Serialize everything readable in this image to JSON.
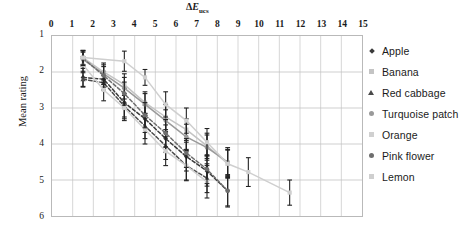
{
  "chart_data": {
    "type": "scatter",
    "title": "",
    "xlabel": "ΔEucs",
    "xlabel_parts": {
      "delta": "Δ",
      "italic": "E",
      "sub": "ucs"
    },
    "ylabel": "Mean rating",
    "xlim": [
      0,
      15
    ],
    "ylim": [
      1,
      6
    ],
    "y_inverted": true,
    "xticks": [
      0,
      1,
      2,
      3,
      4,
      5,
      6,
      7,
      8,
      9,
      10,
      11,
      12,
      13,
      14,
      15
    ],
    "yticks": [
      1,
      2,
      3,
      4,
      5,
      6
    ],
    "grid": true,
    "legend_position": "right",
    "errorbars": true,
    "series": [
      {
        "name": "Apple",
        "color": "#3a3a3a",
        "marker": "diamond",
        "line": "dashed",
        "x": [
          1.5,
          2.5,
          3.5,
          4.5,
          5.5,
          6.5,
          7.5,
          8.5
        ],
        "y": [
          2.15,
          2.2,
          2.85,
          3.3,
          3.85,
          4.35,
          4.75,
          5.3
        ],
        "err": [
          0.25,
          0.22,
          0.4,
          0.38,
          0.38,
          0.4,
          0.42,
          0.42
        ]
      },
      {
        "name": "Banana",
        "color": "#c4c4c4",
        "marker": "square",
        "line": "solid",
        "x": [
          1.5,
          2.5,
          3.5,
          4.5,
          5.5,
          6.5,
          7.5,
          8.5
        ],
        "y": [
          1.6,
          2.0,
          2.35,
          2.85,
          3.25,
          3.6,
          4.05,
          4.55
        ],
        "err": [
          0.2,
          0.25,
          0.3,
          0.3,
          0.35,
          0.3,
          0.35,
          0.38
        ]
      },
      {
        "name": "Red cabbage",
        "color": "#4a4a4a",
        "marker": "triangle",
        "line": "dashed",
        "x": [
          1.5,
          2.5,
          3.5,
          4.5,
          5.5,
          6.5,
          7.5
        ],
        "y": [
          2.2,
          2.3,
          2.95,
          3.5,
          4.05,
          4.6,
          4.95
        ],
        "err": [
          0.22,
          0.2,
          0.35,
          0.35,
          0.38,
          0.4,
          0.4
        ]
      },
      {
        "name": "Turquoise patch",
        "color": "#9a9a9a",
        "marker": "circle",
        "line": "solid",
        "x": [
          1.5,
          2.5,
          3.5,
          4.5,
          5.5,
          6.5,
          7.5,
          8.5
        ],
        "y": [
          1.65,
          2.05,
          2.45,
          2.9,
          3.35,
          3.8,
          4.1,
          4.5
        ],
        "err": [
          0.2,
          0.25,
          0.3,
          0.3,
          0.3,
          0.35,
          0.35,
          0.4
        ]
      },
      {
        "name": "Orange",
        "color": "#d0d0d0",
        "marker": "square",
        "line": "solid",
        "x": [
          1.5,
          2.5,
          3.5,
          4.5,
          5.5,
          6.5,
          7.5
        ],
        "y": [
          1.8,
          2.5,
          3.0,
          3.6,
          4.2,
          4.6,
          5.05
        ],
        "err": [
          0.22,
          0.3,
          0.35,
          0.4,
          0.4,
          0.42,
          0.45
        ]
      },
      {
        "name": "Pink flower",
        "color": "#6e6e6e",
        "marker": "circle",
        "line": "dashed",
        "x": [
          1.5,
          2.5,
          3.5,
          4.5,
          5.5,
          6.5,
          7.5,
          8.5
        ],
        "y": [
          1.62,
          2.1,
          2.6,
          3.2,
          3.7,
          4.25,
          4.7,
          5.3
        ],
        "err": [
          0.2,
          0.25,
          0.32,
          0.35,
          0.38,
          0.4,
          0.4,
          0.45
        ]
      },
      {
        "name": "Lemon",
        "color": "#cfcfcf",
        "marker": "square",
        "line": "solid",
        "x": [
          1.5,
          3.5,
          4.5,
          5.5,
          6.5,
          7.5,
          8.5,
          9.5,
          11.5
        ],
        "y": [
          1.6,
          1.7,
          2.15,
          2.9,
          3.35,
          3.95,
          4.55,
          4.78,
          5.35
        ],
        "err": [
          0.2,
          0.28,
          0.22,
          0.35,
          0.35,
          0.38,
          0.4,
          0.4,
          0.35
        ]
      }
    ]
  },
  "legend": {
    "items": [
      {
        "label": "Apple"
      },
      {
        "label": "Banana"
      },
      {
        "label": "Red cabbage"
      },
      {
        "label": "Turquoise patch"
      },
      {
        "label": "Orange"
      },
      {
        "label": "Pink flower"
      },
      {
        "label": "Lemon"
      }
    ]
  }
}
